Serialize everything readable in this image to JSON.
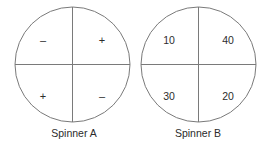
{
  "figure": {
    "background_color": "#ffffff",
    "stroke_color": "#7a7a7a",
    "text_color": "#2d2d2d"
  },
  "spinners": [
    {
      "id": "spinner-a",
      "caption": "Spinner A",
      "sectors": [
        {
          "position": "top-left",
          "label": "–"
        },
        {
          "position": "top-right",
          "label": "+"
        },
        {
          "position": "bottom-left",
          "label": "+"
        },
        {
          "position": "bottom-right",
          "label": "–"
        }
      ]
    },
    {
      "id": "spinner-b",
      "caption": "Spinner B",
      "sectors": [
        {
          "position": "top-left",
          "label": "10"
        },
        {
          "position": "top-right",
          "label": "40"
        },
        {
          "position": "bottom-left",
          "label": "30"
        },
        {
          "position": "bottom-right",
          "label": "20"
        }
      ]
    }
  ]
}
